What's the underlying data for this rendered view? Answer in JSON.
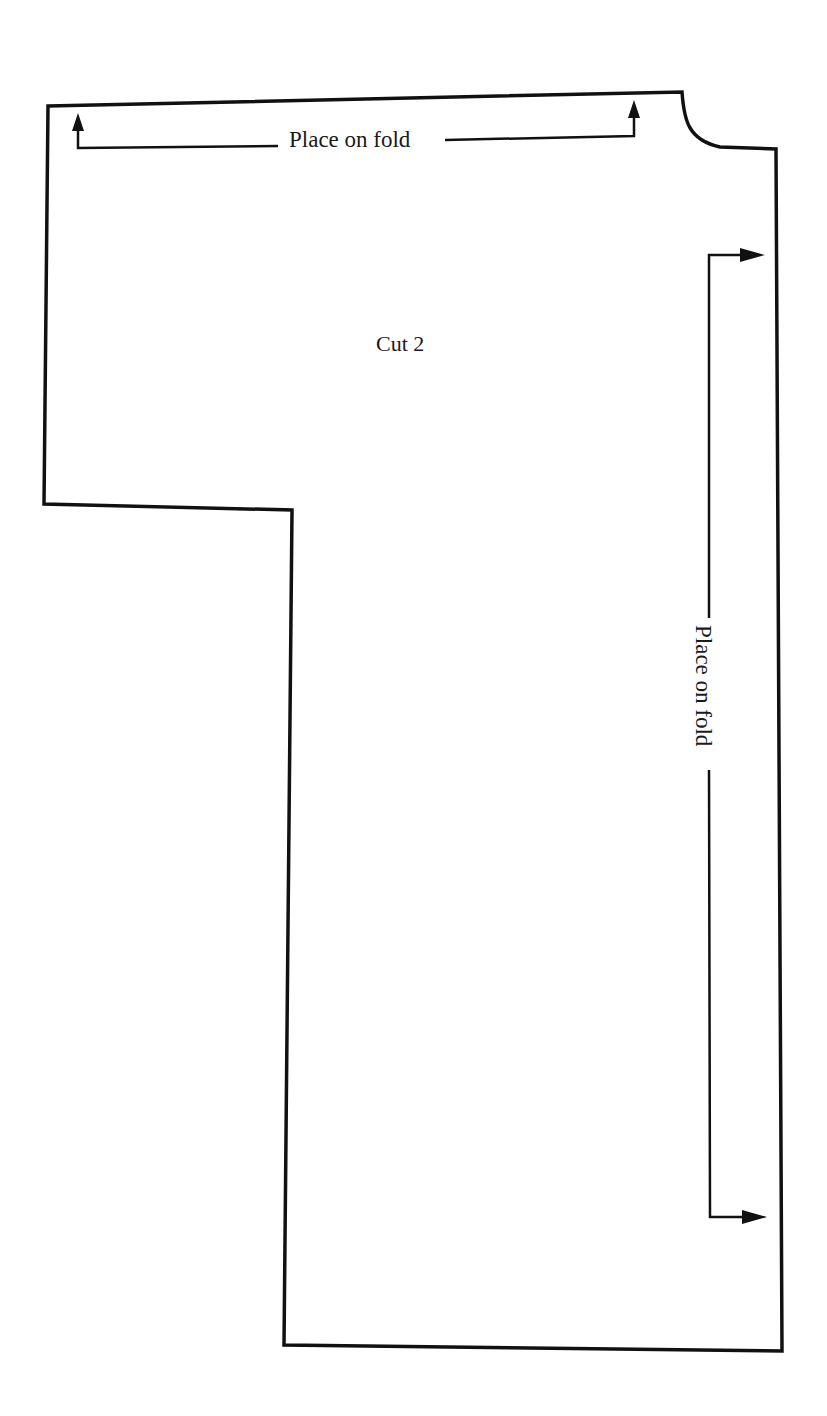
{
  "pattern_piece": {
    "instruction": "Cut 2",
    "outline_color": "#111111",
    "grainlines": [
      {
        "id": "top",
        "label": "Place on fold",
        "orientation": "horizontal",
        "arrow_direction": "up"
      },
      {
        "id": "right",
        "label": "Place on fold",
        "orientation": "vertical",
        "arrow_direction": "right"
      }
    ]
  }
}
